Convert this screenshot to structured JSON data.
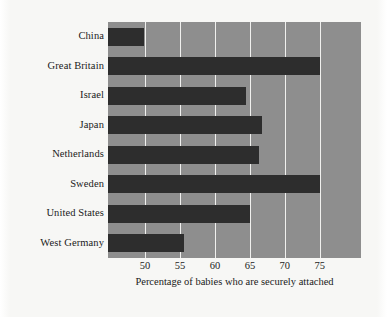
{
  "chart_data": {
    "type": "bar",
    "orientation": "horizontal",
    "title": "",
    "subtitle": "",
    "xlabel": "Percentage of babies who are securely attached",
    "ylabel": "",
    "categories": [
      "China",
      "Great Britain",
      "Israel",
      "Japan",
      "Netherlands",
      "Sweden",
      "United States",
      "West Germany"
    ],
    "values": [
      49.8,
      75.0,
      64.5,
      66.7,
      66.3,
      75.0,
      65.0,
      55.6
    ],
    "xlim": [
      44.7,
      80.9
    ],
    "xticks": [
      50,
      55,
      60,
      65,
      70,
      75
    ],
    "xtick_labels": [
      "50",
      "55",
      "60",
      "65",
      "70",
      "75"
    ],
    "grid": "vertical-white-gridlines",
    "legend": "none",
    "series": [
      {
        "name": "Percentage of babies who are securely attached",
        "values": [
          49.8,
          75.0,
          64.5,
          66.7,
          66.3,
          75.0,
          65.0,
          55.6
        ]
      }
    ],
    "colors": {
      "bar": "#2d2d2d",
      "plot_background": "#8e8e8e",
      "gridline": "#f0f0ee",
      "page_background": "#f7f7f5",
      "text": "#1a1a1a"
    }
  }
}
